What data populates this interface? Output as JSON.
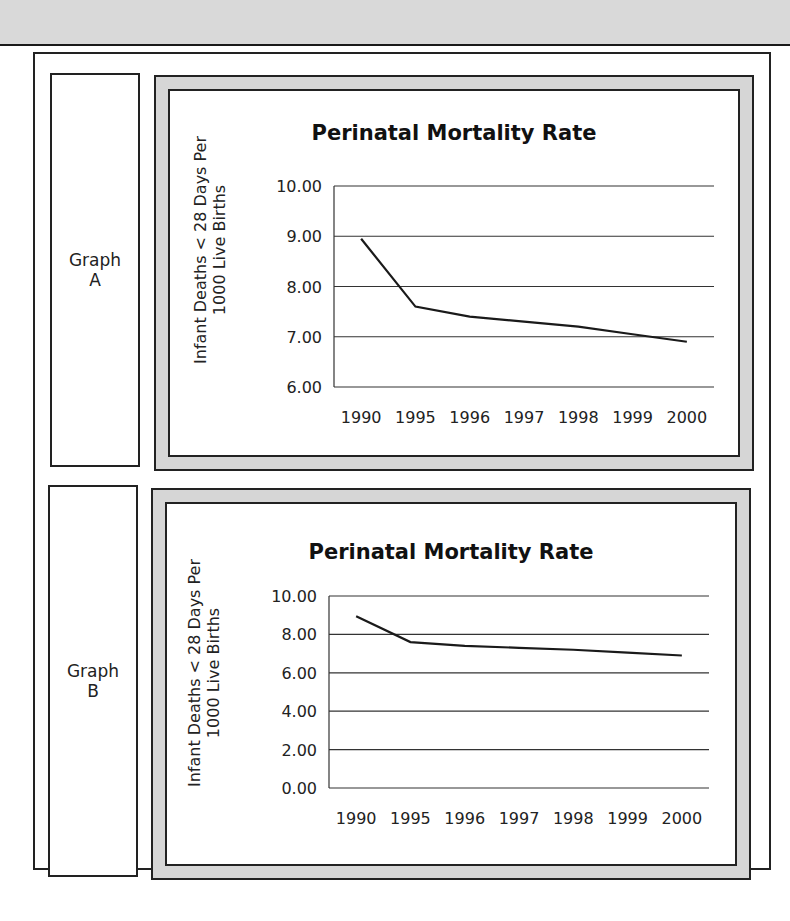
{
  "graphs": {
    "a": {
      "side_label_line1": "Graph",
      "side_label_line2": "A",
      "title": "Perinatal Mortality Rate",
      "ylabel_line1": "Infant Deaths < 28 Days Per",
      "ylabel_line2": "1000 Live Births"
    },
    "b": {
      "side_label_line1": "Graph",
      "side_label_line2": "B",
      "title": "Perinatal Mortality Rate",
      "ylabel_line1": "Infant Deaths < 28 Days Per",
      "ylabel_line2": "1000 Live Births"
    }
  },
  "chart_data": [
    {
      "type": "line",
      "name": "Graph A",
      "title": "Perinatal Mortality Rate",
      "xlabel": "",
      "ylabel": "Infant Deaths < 28 Days Per 1000 Live Births",
      "categories": [
        "1990",
        "1995",
        "1996",
        "1997",
        "1998",
        "1999",
        "2000"
      ],
      "values": [
        8.95,
        7.6,
        7.4,
        7.3,
        7.2,
        7.05,
        6.9
      ],
      "ylim": [
        6.0,
        10.0
      ],
      "yticks": [
        "6.00",
        "7.00",
        "8.00",
        "9.00",
        "10.00"
      ],
      "grid": true,
      "legend": null
    },
    {
      "type": "line",
      "name": "Graph B",
      "title": "Perinatal Mortality Rate",
      "xlabel": "",
      "ylabel": "Infant Deaths < 28 Days Per 1000 Live Births",
      "categories": [
        "1990",
        "1995",
        "1996",
        "1997",
        "1998",
        "1999",
        "2000"
      ],
      "values": [
        8.95,
        7.6,
        7.4,
        7.3,
        7.2,
        7.05,
        6.9
      ],
      "ylim": [
        0.0,
        10.0
      ],
      "yticks": [
        "0.00",
        "2.00",
        "4.00",
        "6.00",
        "8.00",
        "10.00"
      ],
      "grid": true,
      "legend": null
    }
  ]
}
